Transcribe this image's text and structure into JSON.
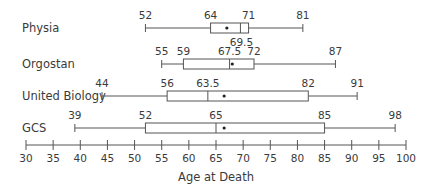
{
  "chart_data": {
    "type": "boxplot",
    "title": "",
    "xlabel": "Age at Death",
    "ylabel": "",
    "xlim": [
      30,
      100
    ],
    "x_ticks": [
      30,
      35,
      40,
      45,
      50,
      55,
      60,
      65,
      70,
      75,
      80,
      85,
      90,
      95,
      100
    ],
    "grid": false,
    "legend": null,
    "series": [
      {
        "name": "Physia",
        "min": 52,
        "q1": 64,
        "median": 69.5,
        "q3": 71,
        "max": 81,
        "mean": 67,
        "labels": [
          "52",
          "64",
          "71",
          "81",
          "69.5"
        ]
      },
      {
        "name": "Orgostan",
        "min": 55,
        "q1": 59,
        "median": 67.5,
        "q3": 72,
        "max": 87,
        "mean": 68,
        "labels": [
          "55",
          "59",
          "67.5",
          "72",
          "87"
        ]
      },
      {
        "name": "United Biology",
        "min": 44,
        "q1": 56,
        "median": 63.5,
        "q3": 82,
        "max": 91,
        "mean": 66.5,
        "labels": [
          "44",
          "56",
          "63.5",
          "82",
          "91"
        ]
      },
      {
        "name": "GCS",
        "min": 39,
        "q1": 52,
        "median": 65,
        "q3": 85,
        "max": 98,
        "mean": 66.5,
        "labels": [
          "39",
          "52",
          "65",
          "85",
          "98"
        ]
      }
    ]
  }
}
